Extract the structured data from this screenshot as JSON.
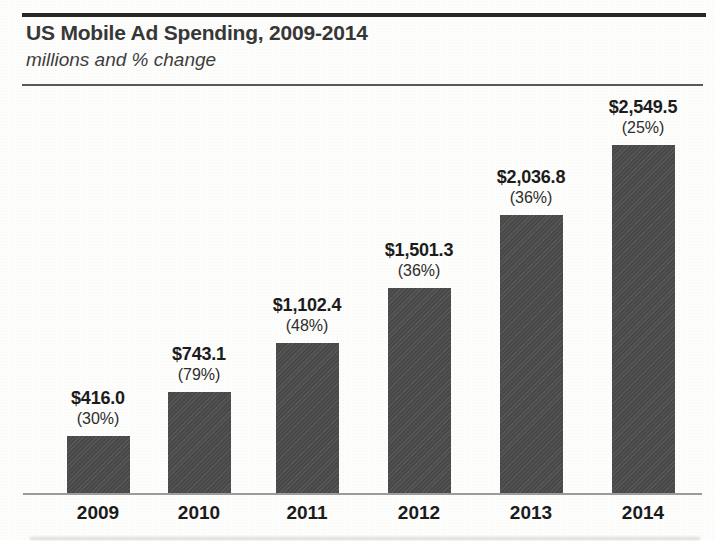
{
  "chart_data": {
    "type": "bar",
    "title": "US Mobile Ad Spending, 2009-2014",
    "subtitle": "millions and % change",
    "unit": "millions of US dollars",
    "categories": [
      "2009",
      "2010",
      "2011",
      "2012",
      "2013",
      "2014"
    ],
    "values": [
      416.0,
      743.1,
      1102.4,
      1501.3,
      2036.8,
      2549.5
    ],
    "pct_change": [
      30,
      79,
      48,
      36,
      36,
      25
    ],
    "value_labels": [
      "$416.0",
      "$743.1",
      "$1,102.4",
      "$1,501.3",
      "$2,036.8",
      "$2,549.5"
    ],
    "pct_labels": [
      "(30%)",
      "(79%)",
      "(48%)",
      "(36%)",
      "(36%)",
      "(25%)"
    ],
    "ylim": [
      0,
      2700
    ],
    "grid": false,
    "legend": false,
    "bar_color": "#4d4d4d",
    "axis_line_color": "#9b9b9b",
    "rule_color": "#272727",
    "text_color": "#1c1c1c"
  }
}
